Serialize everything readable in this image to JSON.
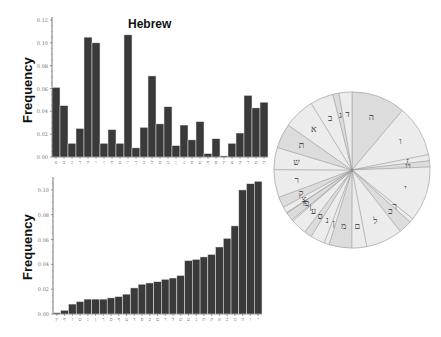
{
  "figure": {
    "top_title": "Hebrew",
    "top_ylabel": "Frequency",
    "bottom_ylabel": "Frequency"
  },
  "colors": {
    "bar": "#3a3a3a",
    "bar_edge": "#1a1a1a",
    "pie_fill_light": "#ececec",
    "pie_fill_mid": "#dcdcdc",
    "pie_line": "#9a9a9a",
    "axis": "#555555"
  },
  "chart_data": [
    {
      "type": "bar",
      "title": "Hebrew",
      "xlabel": "",
      "ylabel": "Frequency",
      "ylim": [
        0,
        0.12
      ],
      "yticks": [
        "0.00",
        "0.02",
        "0.04",
        "0.06",
        "0.08",
        "0.10",
        "0.12"
      ],
      "grid": false,
      "legend": null,
      "categories": [
        "א",
        "ב",
        "ג",
        "ד",
        "ה",
        "ו",
        "ז",
        "ח",
        "ט",
        "י",
        "ך",
        "כ",
        "ל",
        "ם",
        "מ",
        "ן",
        "נ",
        "ס",
        "ע",
        "ף",
        "פ",
        "ץ",
        "צ",
        "ק",
        "ר",
        "ש",
        "ת"
      ],
      "values": [
        0.061,
        0.045,
        0.012,
        0.025,
        0.105,
        0.1,
        0.012,
        0.024,
        0.012,
        0.107,
        0.008,
        0.026,
        0.071,
        0.029,
        0.044,
        0.01,
        0.028,
        0.015,
        0.031,
        0.003,
        0.016,
        0.001,
        0.012,
        0.021,
        0.054,
        0.043,
        0.048
      ]
    },
    {
      "type": "bar",
      "title": "",
      "xlabel": "",
      "ylabel": "Frequency",
      "ylim": [
        0,
        0.108
      ],
      "yticks": [
        "0.00",
        "0.02",
        "0.04",
        "0.06",
        "0.08",
        "0.10"
      ],
      "grid": false,
      "legend": null,
      "categories": [
        "ץ",
        "ף",
        "ז",
        "ט",
        "ג",
        "ן",
        "ך",
        "ס",
        "ף2",
        "צ",
        "ד",
        "פ",
        "ב2",
        "ם",
        "ר",
        "ל",
        "ש",
        "ע",
        "נ",
        "ת",
        "ק",
        "א",
        "כ",
        "מ",
        "ה",
        "ו",
        "י"
      ],
      "values": [
        0.001,
        0.003,
        0.008,
        0.01,
        0.012,
        0.012,
        0.012,
        0.013,
        0.014,
        0.016,
        0.021,
        0.024,
        0.025,
        0.026,
        0.028,
        0.029,
        0.031,
        0.043,
        0.044,
        0.046,
        0.048,
        0.054,
        0.061,
        0.071,
        0.1,
        0.105,
        0.107
      ]
    },
    {
      "type": "pie",
      "title": "",
      "labels": [
        "ה",
        "ו",
        "י",
        "ך",
        "ז",
        "ט",
        "ל",
        "כ",
        "מ",
        "ם",
        "ד",
        "נ",
        "ב",
        "ע",
        "ף",
        "פ",
        "צ",
        "ר",
        "ש",
        "ת",
        "א",
        "ב",
        "ג",
        "ד"
      ],
      "note": "Radial pie of Hebrew letter frequencies; slices start at top and run clockwise"
    }
  ]
}
